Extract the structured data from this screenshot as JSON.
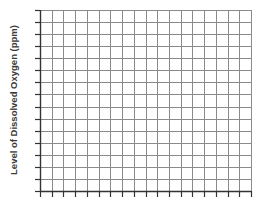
{
  "chart_data": {
    "type": "line",
    "title": "",
    "xlabel": "",
    "ylabel": "Level of Dissolved Oxygen (ppm)",
    "grid": true,
    "series": [],
    "x_tick_labels": [],
    "y_tick_labels": [],
    "grid_columns": 18,
    "grid_rows": 15,
    "note": "Blank graph-paper grid with tick marks; no data plotted"
  },
  "colors": {
    "grid_line": "#8a8a8a",
    "axis_line": "#333333",
    "label_text": "#3a3a3a",
    "background": "#ffffff"
  }
}
